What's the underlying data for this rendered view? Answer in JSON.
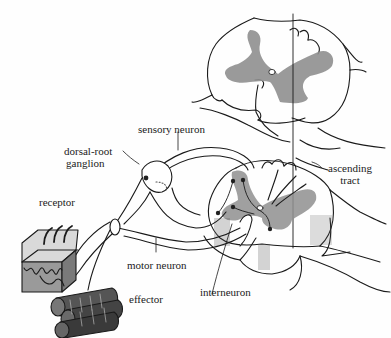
{
  "diagram": {
    "colors": {
      "line": "#1a1a1a",
      "grey_matter": "#8f8f8f",
      "receptor_fill": "#9a9a9a",
      "neuron_dot": "#222222"
    },
    "labels": {
      "sensory_neuron": "sensory neuron",
      "dorsal_root_ganglion_1": "dorsal-root",
      "dorsal_root_ganglion_2": "ganglion",
      "ascending_tract_1": "ascending",
      "ascending_tract_2": "tract",
      "receptor": "receptor",
      "motor_neuron": "motor neuron",
      "interneuron": "interneuron",
      "effector": "effector"
    }
  }
}
